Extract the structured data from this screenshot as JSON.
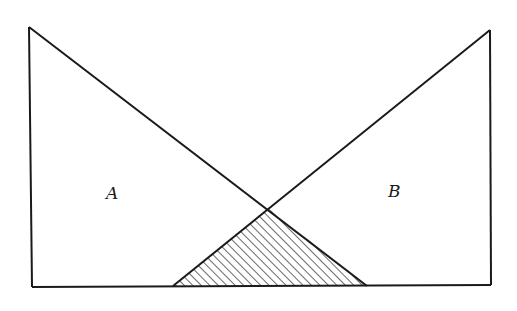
{
  "diagram": {
    "stroke_color": "#1a1a1a",
    "background": "#ffffff",
    "labels": [
      {
        "id": "A",
        "text": "A",
        "x": 106,
        "y": 185
      },
      {
        "id": "B",
        "text": "B",
        "x": 388,
        "y": 183
      }
    ],
    "triangle_a": {
      "apex": [
        29,
        27
      ],
      "bottom_left": [
        32,
        287
      ],
      "hypotenuse_end": [
        367,
        286
      ]
    },
    "triangle_b": {
      "apex": [
        490,
        30
      ],
      "bottom_right": [
        491,
        285
      ],
      "hypotenuse_end": [
        173,
        286
      ]
    },
    "baseline": {
      "from": [
        32,
        287
      ],
      "to": [
        491,
        285
      ]
    },
    "overlap_region": {
      "vertices": [
        [
          173,
          286
        ],
        [
          268,
          208
        ],
        [
          367,
          286
        ]
      ],
      "fill": "hatched",
      "hatch_direction": "diagonal-up-right",
      "hatch_spacing": 6
    }
  }
}
